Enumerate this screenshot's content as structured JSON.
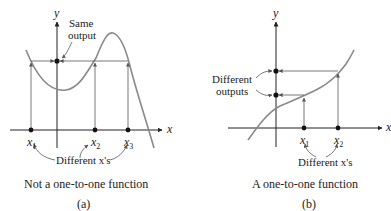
{
  "panel_a": {
    "y_axis_label": "y",
    "x_axis_label": "x",
    "annotation_same_output_line1": "Same",
    "annotation_same_output_line2": "output",
    "x1": "x",
    "x1_sub": "1",
    "x2": "x",
    "x2_sub": "2",
    "x3": "x",
    "x3_sub": "3",
    "different_xs": "Different x's",
    "caption": "Not a one-to-one function",
    "letter": "(a)"
  },
  "panel_b": {
    "y_axis_label": "y",
    "x_axis_label": "x",
    "annotation_diff_outputs_line1": "Different",
    "annotation_diff_outputs_line2": "outputs",
    "x1": "x",
    "x1_sub": "1",
    "x2": "x",
    "x2_sub": "2",
    "different_xs": "Different x's",
    "caption": "A one-to-one function",
    "letter": "(b)"
  },
  "colors": {
    "curve": "#8a8a8a",
    "axis": "#222222",
    "guide": "#555555",
    "point": "#111111"
  }
}
